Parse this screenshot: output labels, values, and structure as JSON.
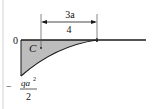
{
  "diagram": {
    "type": "bending-moment-diagram",
    "origin_label": "0",
    "point_label": "C",
    "dimension": {
      "numerator": "3a",
      "denominator": "4"
    },
    "min_value": {
      "sign": "−",
      "numerator": "qa",
      "exponent": "2",
      "denominator": "2"
    },
    "colors": {
      "fill": "#bdbdbd",
      "line": "#1a1a1a",
      "border": "#d0d0d0"
    }
  }
}
